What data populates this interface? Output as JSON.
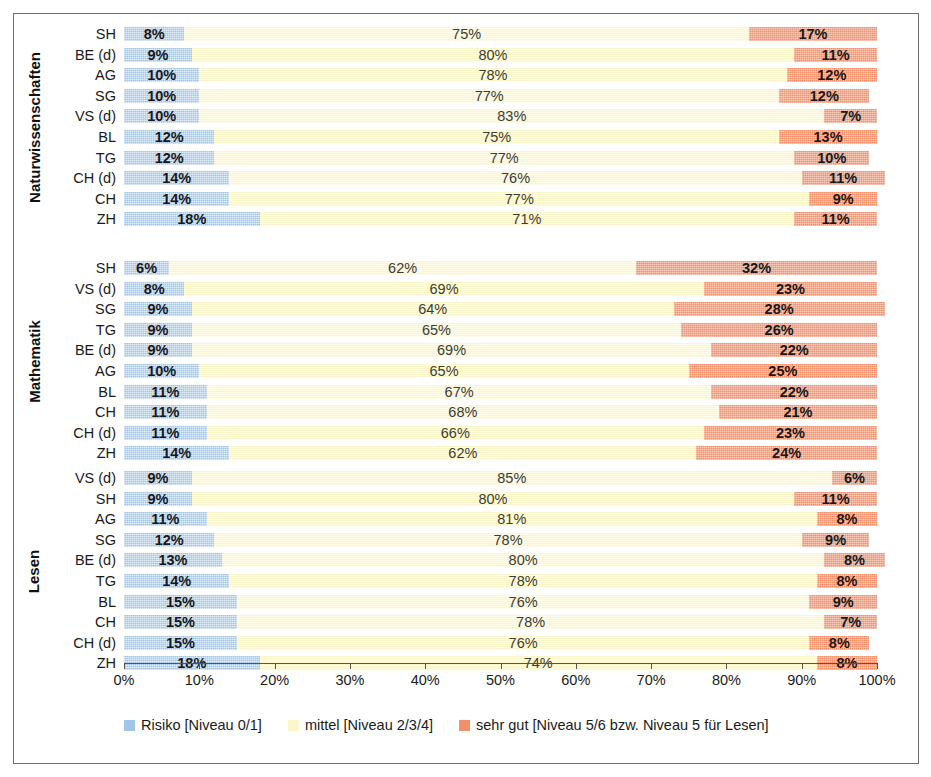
{
  "chart_data": {
    "type": "bar",
    "orientation": "horizontal",
    "stacked": true,
    "stack_mode": "percent",
    "title": "",
    "xlabel": "",
    "ylabel": "",
    "xlim": [
      0,
      100
    ],
    "grid": true,
    "legend_position": "bottom",
    "xticks": [
      "0%",
      "10%",
      "20%",
      "30%",
      "40%",
      "50%",
      "60%",
      "70%",
      "80%",
      "90%",
      "100%"
    ],
    "xtick_values": [
      0,
      10,
      20,
      30,
      40,
      50,
      60,
      70,
      80,
      90,
      100
    ],
    "series": [
      {
        "name": "Risiko [Niveau 0/1]",
        "color": "#9fc5e8"
      },
      {
        "name": "mittel [Niveau 2/3/4]",
        "color": "#fcf6cd"
      },
      {
        "name": "sehr gut [Niveau 5/6 bzw. Niveau 5 für Lesen]",
        "color": "#f2906c"
      }
    ],
    "panels": [
      {
        "title": "Naturwissenschaften",
        "categories": [
          "SH",
          "BE (d)",
          "AG",
          "SG",
          "VS (d)",
          "BL",
          "TG",
          "CH (d)",
          "CH",
          "ZH"
        ],
        "rows": [
          {
            "category": "SH",
            "risiko": 8,
            "mittel": 75,
            "sehr_gut": 17,
            "labels": [
              "8%",
              "75%",
              "17%"
            ]
          },
          {
            "category": "BE (d)",
            "risiko": 9,
            "mittel": 80,
            "sehr_gut": 11,
            "labels": [
              "9%",
              "80%",
              "11%"
            ]
          },
          {
            "category": "AG",
            "risiko": 10,
            "mittel": 78,
            "sehr_gut": 12,
            "labels": [
              "10%",
              "78%",
              "12%"
            ]
          },
          {
            "category": "SG",
            "risiko": 10,
            "mittel": 77,
            "sehr_gut": 12,
            "labels": [
              "10%",
              "77%",
              "12%"
            ]
          },
          {
            "category": "VS (d)",
            "risiko": 10,
            "mittel": 83,
            "sehr_gut": 7,
            "labels": [
              "10%",
              "83%",
              "7%"
            ]
          },
          {
            "category": "BL",
            "risiko": 12,
            "mittel": 75,
            "sehr_gut": 13,
            "labels": [
              "12%",
              "75%",
              "13%"
            ]
          },
          {
            "category": "TG",
            "risiko": 12,
            "mittel": 77,
            "sehr_gut": 10,
            "labels": [
              "12%",
              "77%",
              "10%"
            ]
          },
          {
            "category": "CH (d)",
            "risiko": 14,
            "mittel": 76,
            "sehr_gut": 11,
            "labels": [
              "14%",
              "76%",
              "11%"
            ]
          },
          {
            "category": "CH",
            "risiko": 14,
            "mittel": 77,
            "sehr_gut": 9,
            "labels": [
              "14%",
              "77%",
              "9%"
            ]
          },
          {
            "category": "ZH",
            "risiko": 18,
            "mittel": 71,
            "sehr_gut": 11,
            "labels": [
              "18%",
              "71%",
              "11%"
            ]
          }
        ]
      },
      {
        "title": "Mathematik",
        "categories": [
          "SH",
          "VS (d)",
          "SG",
          "TG",
          "BE (d)",
          "AG",
          "BL",
          "CH",
          "CH (d)",
          "ZH"
        ],
        "rows": [
          {
            "category": "SH",
            "risiko": 6,
            "mittel": 62,
            "sehr_gut": 32,
            "labels": [
              "6%",
              "62%",
              "32%"
            ]
          },
          {
            "category": "VS (d)",
            "risiko": 8,
            "mittel": 69,
            "sehr_gut": 23,
            "labels": [
              "8%",
              "69%",
              "23%"
            ]
          },
          {
            "category": "SG",
            "risiko": 9,
            "mittel": 64,
            "sehr_gut": 28,
            "labels": [
              "9%",
              "64%",
              "28%"
            ]
          },
          {
            "category": "TG",
            "risiko": 9,
            "mittel": 65,
            "sehr_gut": 26,
            "labels": [
              "9%",
              "65%",
              "26%"
            ]
          },
          {
            "category": "BE (d)",
            "risiko": 9,
            "mittel": 69,
            "sehr_gut": 22,
            "labels": [
              "9%",
              "69%",
              "22%"
            ]
          },
          {
            "category": "AG",
            "risiko": 10,
            "mittel": 65,
            "sehr_gut": 25,
            "labels": [
              "10%",
              "65%",
              "25%"
            ]
          },
          {
            "category": "BL",
            "risiko": 11,
            "mittel": 67,
            "sehr_gut": 22,
            "labels": [
              "11%",
              "67%",
              "22%"
            ]
          },
          {
            "category": "CH",
            "risiko": 11,
            "mittel": 68,
            "sehr_gut": 21,
            "labels": [
              "11%",
              "68%",
              "21%"
            ]
          },
          {
            "category": "CH (d)",
            "risiko": 11,
            "mittel": 66,
            "sehr_gut": 23,
            "labels": [
              "11%",
              "66%",
              "23%"
            ]
          },
          {
            "category": "ZH",
            "risiko": 14,
            "mittel": 62,
            "sehr_gut": 24,
            "labels": [
              "14%",
              "62%",
              "24%"
            ]
          }
        ]
      },
      {
        "title": "Lesen",
        "categories": [
          "VS (d)",
          "SH",
          "AG",
          "SG",
          "BE (d)",
          "TG",
          "BL",
          "CH",
          "CH (d)",
          "ZH"
        ],
        "rows": [
          {
            "category": "VS (d)",
            "risiko": 9,
            "mittel": 85,
            "sehr_gut": 6,
            "labels": [
              "9%",
              "85%",
              "6%"
            ]
          },
          {
            "category": "SH",
            "risiko": 9,
            "mittel": 80,
            "sehr_gut": 11,
            "labels": [
              "9%",
              "80%",
              "11%"
            ]
          },
          {
            "category": "AG",
            "risiko": 11,
            "mittel": 81,
            "sehr_gut": 8,
            "labels": [
              "11%",
              "81%",
              "8%"
            ]
          },
          {
            "category": "SG",
            "risiko": 12,
            "mittel": 78,
            "sehr_gut": 9,
            "labels": [
              "12%",
              "78%",
              "9%"
            ]
          },
          {
            "category": "BE (d)",
            "risiko": 13,
            "mittel": 80,
            "sehr_gut": 8,
            "labels": [
              "13%",
              "80%",
              "8%"
            ]
          },
          {
            "category": "TG",
            "risiko": 14,
            "mittel": 78,
            "sehr_gut": 8,
            "labels": [
              "14%",
              "78%",
              "8%"
            ]
          },
          {
            "category": "BL",
            "risiko": 15,
            "mittel": 76,
            "sehr_gut": 9,
            "labels": [
              "15%",
              "76%",
              "9%"
            ]
          },
          {
            "category": "CH",
            "risiko": 15,
            "mittel": 78,
            "sehr_gut": 7,
            "labels": [
              "15%",
              "78%",
              "7%"
            ]
          },
          {
            "category": "CH (d)",
            "risiko": 15,
            "mittel": 76,
            "sehr_gut": 8,
            "labels": [
              "15%",
              "76%",
              "8%"
            ]
          },
          {
            "category": "ZH",
            "risiko": 18,
            "mittel": 74,
            "sehr_gut": 8,
            "labels": [
              "18%",
              "74%",
              "8%"
            ]
          }
        ]
      }
    ]
  },
  "legend": {
    "items": [
      {
        "label": "Risiko [Niveau 0/1]",
        "color": "#9fc5e8"
      },
      {
        "label": "mittel [Niveau 2/3/4]",
        "color": "#fcf6cd"
      },
      {
        "label": "sehr gut [Niveau 5/6 bzw. Niveau 5 für Lesen]",
        "color": "#f2906c"
      }
    ]
  }
}
